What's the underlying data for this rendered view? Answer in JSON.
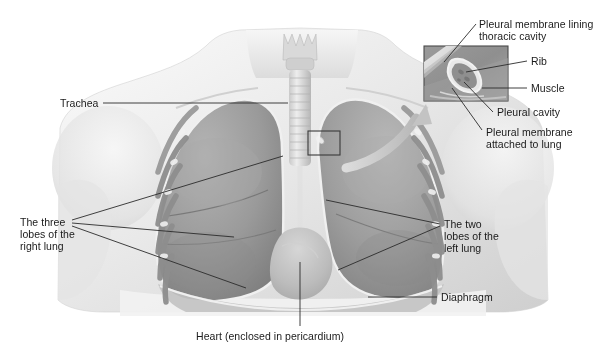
{
  "figure": {
    "width": 606,
    "height": 358,
    "background": "#ffffff",
    "ink_color": "#1a1a1a",
    "line_color": "#2b2b2b"
  },
  "labels": {
    "trachea": "Trachea",
    "three_lobes_right_lung": "The three\nlobes of the\nright lung",
    "two_lobes_left_lung": "The two\nlobes of the\nleft lung",
    "diaphragm": "Diaphragm",
    "heart": "Heart (enclosed in pericardium)",
    "pleural_membrane_lining": "Pleural membrane lining\nthoracic cavity",
    "rib": "Rib",
    "muscle": "Muscle",
    "pleural_cavity": "Pleural cavity",
    "pleural_membrane_attached": "Pleural membrane\nattached to lung"
  },
  "inset": {
    "name": "magnified-chest-wall-inset",
    "box": {
      "x": 424,
      "y": 46,
      "width": 84,
      "height": 55
    },
    "source_box": {
      "x": 308,
      "y": 131,
      "width": 32,
      "height": 24
    },
    "contents": [
      "pleural-membrane-band",
      "rib-cross-section",
      "muscle-layer",
      "pleural-cavity-gap"
    ]
  },
  "anatomy": {
    "structures": [
      "neck",
      "shoulders",
      "larynx",
      "trachea",
      "right-lung-upper-lobe",
      "right-lung-middle-lobe",
      "right-lung-lower-lobe",
      "left-lung-upper-lobe",
      "left-lung-lower-lobe",
      "heart-pericardium",
      "diaphragm",
      "rib-cage"
    ]
  },
  "colors": {
    "body_light": "#efefef",
    "body_mid": "#d7d7d7",
    "lung_light": "#b9b9b9",
    "lung_mid": "#9c9c9c",
    "lung_dark": "#7e7e7e",
    "pleura_highlight": "#f4f4f4",
    "rib_gray": "#c6c6c6",
    "inset_dark": "#8c8c8c",
    "arrow_gray": "#c9c9c9"
  }
}
